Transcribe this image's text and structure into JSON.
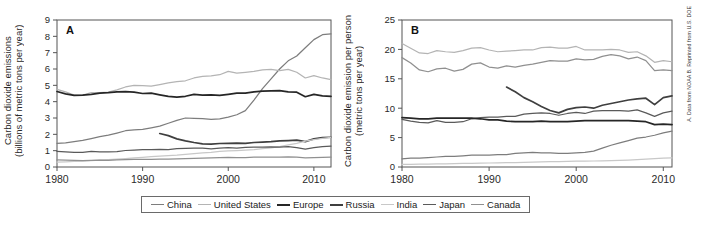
{
  "figure": {
    "credit": "A. Data from NOAA B. Reprinted from U.S. DOE"
  },
  "legend": {
    "items": [
      {
        "label": "China",
        "color": "#7d7d7d"
      },
      {
        "label": "United States",
        "color": "#b4b4b4"
      },
      {
        "label": "Europe",
        "color": "#262626"
      },
      {
        "label": "Russia",
        "color": "#3f3f3f"
      },
      {
        "label": "India",
        "color": "#c8c8c8"
      },
      {
        "label": "Japan",
        "color": "#5a5a5a"
      },
      {
        "label": "Canada",
        "color": "#909090"
      }
    ]
  },
  "chart_data": [
    {
      "type": "line",
      "panel": "A",
      "title": "",
      "xlabel": "",
      "ylabel": "Carbon dioxide emissions\n(billions of metric tons per year)",
      "xlim": [
        1980,
        2012
      ],
      "ylim": [
        0,
        9
      ],
      "xticks": [
        1980,
        1990,
        2000,
        2010
      ],
      "yticks": [
        0,
        1,
        2,
        3,
        4,
        5,
        6,
        7,
        8,
        9
      ],
      "grid": false,
      "legend_position": "bottom",
      "x": [
        1980,
        1981,
        1982,
        1983,
        1984,
        1985,
        1986,
        1987,
        1988,
        1989,
        1990,
        1991,
        1992,
        1993,
        1994,
        1995,
        1996,
        1997,
        1998,
        1999,
        2000,
        2001,
        2002,
        2003,
        2004,
        2005,
        2006,
        2007,
        2008,
        2009,
        2010,
        2011,
        2012
      ],
      "series": [
        {
          "name": "China",
          "color": "#7d7d7d",
          "values": [
            1.45,
            1.48,
            1.56,
            1.63,
            1.74,
            1.86,
            1.95,
            2.08,
            2.22,
            2.28,
            2.3,
            2.4,
            2.5,
            2.68,
            2.85,
            3.0,
            2.98,
            2.96,
            2.92,
            2.95,
            3.05,
            3.2,
            3.45,
            4.1,
            4.8,
            5.4,
            6.0,
            6.5,
            6.8,
            7.3,
            7.8,
            8.1,
            8.15
          ]
        },
        {
          "name": "United States",
          "color": "#b4b4b4",
          "values": [
            4.75,
            4.6,
            4.4,
            4.4,
            4.55,
            4.55,
            4.58,
            4.72,
            4.9,
            5.0,
            4.98,
            4.95,
            5.05,
            5.15,
            5.22,
            5.28,
            5.45,
            5.55,
            5.58,
            5.65,
            5.85,
            5.75,
            5.8,
            5.85,
            5.95,
            5.98,
            5.9,
            5.98,
            5.8,
            5.45,
            5.6,
            5.45,
            5.35
          ]
        },
        {
          "name": "Europe",
          "color": "#262626",
          "values": [
            4.62,
            4.48,
            4.38,
            4.4,
            4.45,
            4.52,
            4.55,
            4.6,
            4.62,
            4.58,
            4.5,
            4.52,
            4.42,
            4.32,
            4.28,
            4.33,
            4.45,
            4.4,
            4.42,
            4.38,
            4.45,
            4.52,
            4.52,
            4.6,
            4.65,
            4.66,
            4.68,
            4.6,
            4.58,
            4.3,
            4.45,
            4.35,
            4.32
          ]
        },
        {
          "name": "Russia",
          "color": "#3f3f3f",
          "values": [
            null,
            null,
            null,
            null,
            null,
            null,
            null,
            null,
            null,
            null,
            null,
            null,
            2.05,
            1.92,
            1.72,
            1.6,
            1.5,
            1.42,
            1.4,
            1.44,
            1.45,
            1.46,
            1.45,
            1.5,
            1.52,
            1.55,
            1.6,
            1.62,
            1.65,
            1.55,
            1.72,
            1.8,
            1.82
          ]
        },
        {
          "name": "India",
          "color": "#c8c8c8",
          "values": [
            0.3,
            0.32,
            0.34,
            0.36,
            0.39,
            0.42,
            0.45,
            0.48,
            0.52,
            0.56,
            0.59,
            0.63,
            0.66,
            0.69,
            0.72,
            0.78,
            0.82,
            0.86,
            0.89,
            0.95,
            0.98,
            1.0,
            1.03,
            1.06,
            1.12,
            1.17,
            1.25,
            1.35,
            1.45,
            1.58,
            1.68,
            1.75,
            1.82
          ]
        },
        {
          "name": "Japan",
          "color": "#5a5a5a",
          "values": [
            0.95,
            0.92,
            0.9,
            0.9,
            0.95,
            0.93,
            0.93,
            0.94,
            1.01,
            1.04,
            1.06,
            1.07,
            1.08,
            1.07,
            1.13,
            1.14,
            1.15,
            1.15,
            1.11,
            1.15,
            1.18,
            1.16,
            1.2,
            1.22,
            1.22,
            1.23,
            1.22,
            1.25,
            1.18,
            1.1,
            1.18,
            1.25,
            1.28
          ]
        },
        {
          "name": "Canada",
          "color": "#909090",
          "values": [
            0.43,
            0.42,
            0.4,
            0.39,
            0.41,
            0.42,
            0.41,
            0.43,
            0.45,
            0.46,
            0.46,
            0.46,
            0.48,
            0.48,
            0.5,
            0.52,
            0.53,
            0.55,
            0.56,
            0.57,
            0.59,
            0.58,
            0.58,
            0.6,
            0.6,
            0.61,
            0.6,
            0.62,
            0.6,
            0.56,
            0.58,
            0.59,
            0.6
          ]
        }
      ]
    },
    {
      "type": "line",
      "panel": "B",
      "title": "",
      "xlabel": "",
      "ylabel": "Carbon dioxide emission per person\n(metric tons per year)",
      "xlim": [
        1980,
        2011
      ],
      "ylim": [
        0,
        25
      ],
      "xticks": [
        1980,
        1990,
        2000,
        2010
      ],
      "yticks": [
        0,
        5,
        10,
        15,
        20,
        25
      ],
      "grid": false,
      "legend_position": "bottom",
      "x": [
        1980,
        1981,
        1982,
        1983,
        1984,
        1985,
        1986,
        1987,
        1988,
        1989,
        1990,
        1991,
        1992,
        1993,
        1994,
        1995,
        1996,
        1997,
        1998,
        1999,
        2000,
        2001,
        2002,
        2003,
        2004,
        2005,
        2006,
        2007,
        2008,
        2009,
        2010,
        2011
      ],
      "series": [
        {
          "name": "United States",
          "color": "#b4b4b4",
          "values": [
            21.0,
            20.2,
            19.4,
            19.3,
            19.8,
            19.6,
            19.5,
            19.8,
            20.2,
            20.3,
            19.9,
            19.6,
            19.7,
            19.8,
            19.9,
            19.9,
            20.3,
            20.4,
            20.2,
            20.2,
            20.5,
            19.9,
            19.9,
            19.9,
            20.0,
            19.9,
            19.5,
            19.6,
            18.9,
            17.8,
            18.1,
            17.9
          ]
        },
        {
          "name": "Canada",
          "color": "#909090",
          "values": [
            18.6,
            17.7,
            16.5,
            16.2,
            16.7,
            16.8,
            16.3,
            16.6,
            17.5,
            17.7,
            17.0,
            16.8,
            17.2,
            17.0,
            17.3,
            17.5,
            17.8,
            18.1,
            18.0,
            18.0,
            18.4,
            18.2,
            18.3,
            18.8,
            19.1,
            18.9,
            18.4,
            18.7,
            18.1,
            16.4,
            16.5,
            16.4
          ]
        },
        {
          "name": "Russia",
          "color": "#3f3f3f",
          "values": [
            null,
            null,
            null,
            null,
            null,
            null,
            null,
            null,
            null,
            null,
            null,
            null,
            13.6,
            12.8,
            11.8,
            11.1,
            10.3,
            9.6,
            9.2,
            9.8,
            10.1,
            10.2,
            10.0,
            10.5,
            10.8,
            11.1,
            11.4,
            11.6,
            11.7,
            10.6,
            11.8,
            12.1
          ]
        },
        {
          "name": "Japan",
          "color": "#5a5a5a",
          "values": [
            8.1,
            7.8,
            7.6,
            7.5,
            7.9,
            7.6,
            7.6,
            7.7,
            8.2,
            8.4,
            8.5,
            8.5,
            8.6,
            8.6,
            9.0,
            9.1,
            9.2,
            9.1,
            8.8,
            9.1,
            9.3,
            9.1,
            9.5,
            9.6,
            9.6,
            9.6,
            9.5,
            9.7,
            9.2,
            8.6,
            9.2,
            9.5
          ]
        },
        {
          "name": "Europe",
          "color": "#262626",
          "values": [
            8.4,
            8.3,
            8.2,
            8.2,
            8.3,
            8.3,
            8.3,
            8.3,
            8.3,
            8.2,
            8.0,
            8.0,
            7.8,
            7.7,
            7.7,
            7.7,
            7.8,
            7.7,
            7.7,
            7.7,
            7.8,
            7.9,
            7.9,
            7.9,
            7.9,
            7.9,
            7.9,
            7.8,
            7.7,
            7.2,
            7.3,
            7.2
          ]
        },
        {
          "name": "China",
          "color": "#7d7d7d",
          "values": [
            1.4,
            1.5,
            1.5,
            1.6,
            1.7,
            1.8,
            1.8,
            1.9,
            2.0,
            2.0,
            2.0,
            2.1,
            2.1,
            2.3,
            2.4,
            2.5,
            2.4,
            2.4,
            2.3,
            2.3,
            2.4,
            2.5,
            2.7,
            3.2,
            3.7,
            4.1,
            4.5,
            4.9,
            5.1,
            5.4,
            5.8,
            6.1
          ]
        },
        {
          "name": "India",
          "color": "#c8c8c8",
          "values": [
            0.44,
            0.46,
            0.48,
            0.5,
            0.52,
            0.55,
            0.57,
            0.6,
            0.63,
            0.66,
            0.68,
            0.72,
            0.74,
            0.76,
            0.79,
            0.84,
            0.87,
            0.9,
            0.92,
            0.97,
            0.99,
            1.0,
            1.02,
            1.04,
            1.09,
            1.12,
            1.18,
            1.26,
            1.33,
            1.43,
            1.5,
            1.55
          ]
        }
      ]
    }
  ]
}
